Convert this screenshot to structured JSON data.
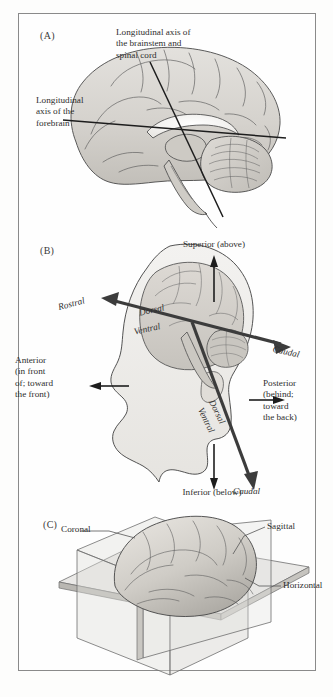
{
  "figure": {
    "background_color": "#fdfdfc",
    "frame_color": "#8a8a8a",
    "ink_color": "#2e2e2e"
  },
  "panel_a": {
    "letter": "(A)",
    "labels": {
      "brainstem_axis": "Longitudinal axis of\nthe brainstem and\nspinal cord",
      "forebrain_axis": "Longitudinal\naxis of the\nforebrain"
    }
  },
  "panel_b": {
    "letter": "(B)",
    "labels": {
      "superior": "Superior (above)",
      "inferior": "Inferior (below)",
      "anterior": "Anterior\n(in front\nof; toward\nthe front)",
      "posterior": "Posterior\n(behind;\ntoward\nthe back)",
      "rostral": "Rostral",
      "caudal_axis": "Caudal",
      "caudal_spinal": "Caudal",
      "dorsal_forebrain": "Dorsal",
      "ventral_forebrain": "Ventral",
      "dorsal_brainstem": "Dorsal",
      "ventral_brainstem": "Ventral"
    }
  },
  "panel_c": {
    "letter": "(C)",
    "labels": {
      "coronal": "Coronal",
      "sagittal": "Sagittal",
      "horizontal": "Horizontal"
    }
  }
}
